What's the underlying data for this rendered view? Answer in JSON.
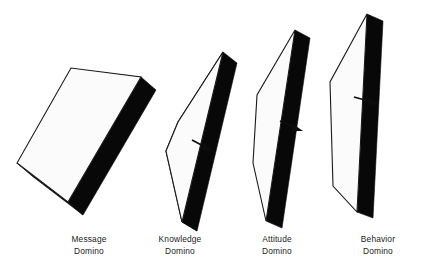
{
  "figure": {
    "background_color": "#ffffff",
    "face_color": "#fbfbfb",
    "edge_color": "#080808",
    "outline_color": "#1a1a1a",
    "arrow_color": "#0d0d0d"
  },
  "dominoes": [
    {
      "id": "message",
      "label_line1": "Message",
      "label_line2": "Domino",
      "state": "fallen",
      "order": 1
    },
    {
      "id": "knowledge",
      "label_line1": "Knowledge",
      "label_line2": "Domino",
      "state": "falling",
      "order": 2
    },
    {
      "id": "attitude",
      "label_line1": "Attitude",
      "label_line2": "Domino",
      "state": "tipping",
      "order": 3
    },
    {
      "id": "behavior",
      "label_line1": "Behavior",
      "label_line2": "Domino",
      "state": "upright",
      "order": 4
    }
  ],
  "arrows": [
    {
      "id": "arrow-message-to-knowledge",
      "from": "message",
      "to": "knowledge"
    },
    {
      "id": "arrow-knowledge-to-attitude",
      "from": "knowledge",
      "to": "attitude"
    },
    {
      "id": "arrow-attitude-to-behavior",
      "from": "attitude",
      "to": "behavior"
    }
  ]
}
